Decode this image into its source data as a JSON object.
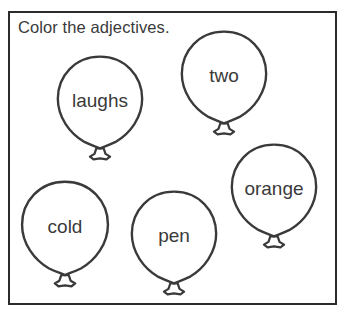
{
  "worksheet": {
    "instruction": "Color the adjectives.",
    "ink_color": "#3a3a3a",
    "frame_color": "#2b2b2b",
    "background_color": "#ffffff"
  },
  "balloons": [
    {
      "word": "laughs",
      "name": "balloon-laughs",
      "left": 54,
      "top": 53,
      "width": 92,
      "height": 110,
      "font_size": 19
    },
    {
      "word": "two",
      "name": "balloon-two",
      "left": 178,
      "top": 28,
      "width": 92,
      "height": 110,
      "font_size": 19
    },
    {
      "word": "orange",
      "name": "balloon-orange",
      "left": 228,
      "top": 141,
      "width": 92,
      "height": 110,
      "font_size": 19
    },
    {
      "word": "cold",
      "name": "balloon-cold",
      "left": 18,
      "top": 178,
      "width": 94,
      "height": 112,
      "font_size": 19
    },
    {
      "word": "pen",
      "name": "balloon-pen",
      "left": 128,
      "top": 188,
      "width": 92,
      "height": 110,
      "font_size": 19
    }
  ]
}
